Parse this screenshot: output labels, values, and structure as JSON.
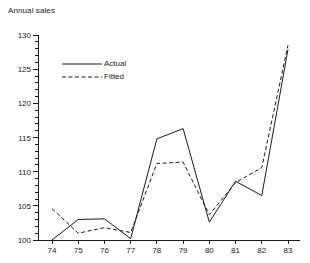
{
  "chart_data": {
    "type": "line",
    "title": "Annual sales",
    "xlabel": "",
    "ylabel": "",
    "xlim": [
      74,
      83
    ],
    "ylim": [
      100,
      130
    ],
    "ytick_step": 5,
    "yminor_step": 1,
    "grid": false,
    "legend_position": "inside-top-left",
    "x": [
      74,
      75,
      76,
      77,
      78,
      79,
      80,
      81,
      82,
      83
    ],
    "categories": [
      "74",
      "75",
      "76",
      "77",
      "78",
      "79",
      "80",
      "81",
      "82",
      "83"
    ],
    "ytick_labels": [
      "100",
      "105",
      "110",
      "115",
      "120",
      "125",
      "130"
    ],
    "ytick_values": [
      100,
      105,
      110,
      115,
      120,
      125,
      130
    ],
    "series": [
      {
        "name": "Actual",
        "style": "solid",
        "color": "#1a1a1a",
        "values": [
          100.0,
          103.0,
          103.1,
          100.2,
          114.8,
          116.3,
          102.6,
          108.6,
          106.5,
          127.9
        ]
      },
      {
        "name": "Fitted",
        "style": "dashed",
        "color": "#1a1a1a",
        "values": [
          104.6,
          101.0,
          101.8,
          101.1,
          111.2,
          111.4,
          103.7,
          108.4,
          110.6,
          128.5
        ]
      }
    ]
  },
  "legend": {
    "items": [
      {
        "label": "Actual",
        "style": "solid"
      },
      {
        "label": "Fitted",
        "style": "dashed"
      }
    ]
  },
  "axis": {
    "color": "#1a1a1a"
  }
}
